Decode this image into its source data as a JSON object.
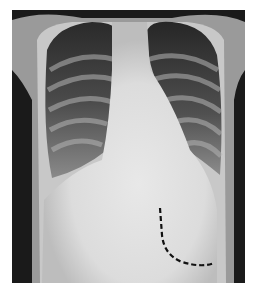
{
  "figure": {
    "annotation": "dashed-curve"
  }
}
